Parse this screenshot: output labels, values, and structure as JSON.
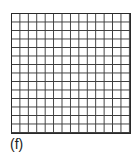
{
  "figure": {
    "label": "(f)",
    "grid": {
      "rows": 14,
      "columns": 14,
      "line_color": "#3a3a3a",
      "background": "#ffffff"
    }
  }
}
